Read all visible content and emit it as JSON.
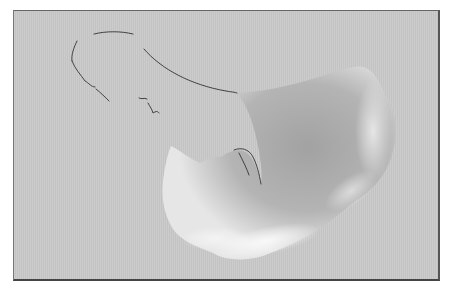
{
  "image": {
    "description": "Grayscale photograph of a curved translucent specimen on a light gray background with a thin outline tracing the missing upper portion",
    "colors": {
      "background": "#c9c9c9",
      "specimen_dark": "#9a9a9a",
      "specimen_mid": "#b0b0b0",
      "specimen_highlight": "#eeeeee",
      "outline": "#333333",
      "frame_border": "#555555"
    }
  }
}
